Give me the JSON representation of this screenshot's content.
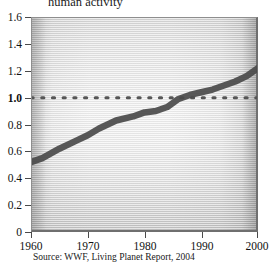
{
  "chart_data": {
    "type": "line",
    "title": "human activity",
    "xlabel": "",
    "ylabel": "",
    "xlim": [
      1960,
      2000
    ],
    "ylim": [
      0,
      1.6
    ],
    "grid": false,
    "legend": "none",
    "source": "Source: WWF, Living Planet Report, 2004",
    "y_ticks": [
      "1.6",
      "1.4",
      "1.2",
      "1.0",
      "0.8",
      "0.6",
      "0.4",
      "0.2",
      "0"
    ],
    "y_tick_values": [
      1.6,
      1.4,
      1.2,
      1.0,
      0.8,
      0.6,
      0.4,
      0.2,
      0
    ],
    "y_tick_emphasis": "1.0",
    "x_ticks": [
      "1960",
      "1970",
      "1980",
      "1990",
      "2000"
    ],
    "x_tick_values": [
      1960,
      1970,
      1980,
      1990,
      2000
    ],
    "series": [
      {
        "name": "Ecological Footprint",
        "style": "solid-thick",
        "color": "#4a4a4a",
        "x": [
          1960,
          1962,
          1965,
          1968,
          1970,
          1972,
          1975,
          1978,
          1980,
          1982,
          1984,
          1986,
          1988,
          1990,
          1992,
          1994,
          1996,
          1998,
          2000
        ],
        "values": [
          0.52,
          0.55,
          0.62,
          0.68,
          0.72,
          0.77,
          0.83,
          0.86,
          0.89,
          0.9,
          0.93,
          0.99,
          1.02,
          1.04,
          1.06,
          1.09,
          1.12,
          1.16,
          1.22
        ]
      },
      {
        "name": "Earth biocapacity threshold",
        "style": "dotted",
        "color": "#555555",
        "constant_value": 1.0,
        "x": [
          1960,
          2000
        ],
        "values": [
          1.0,
          1.0
        ]
      }
    ]
  }
}
